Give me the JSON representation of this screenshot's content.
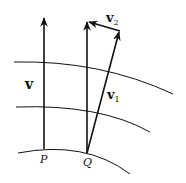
{
  "diagram": {
    "title": "",
    "labels": {
      "v": "v",
      "v1_main": "v",
      "v1_sub": "1",
      "v2_main": "v",
      "v2_sub": "2",
      "P": "P",
      "Q": "Q"
    },
    "colors": {
      "stroke": "#111111",
      "background": "#ffffff"
    },
    "elements": [
      {
        "type": "curve",
        "name": "streamline-top"
      },
      {
        "type": "curve",
        "name": "streamline-middle"
      },
      {
        "type": "curve",
        "name": "streamline-bottom"
      },
      {
        "type": "arrow",
        "name": "vector-v-at-P",
        "label": "v"
      },
      {
        "type": "arrow",
        "name": "vector-v-at-Q",
        "label": "v"
      },
      {
        "type": "arrow",
        "name": "vector-v1",
        "label": "v1"
      },
      {
        "type": "arrow",
        "name": "vector-v2",
        "label": "v2"
      }
    ]
  }
}
